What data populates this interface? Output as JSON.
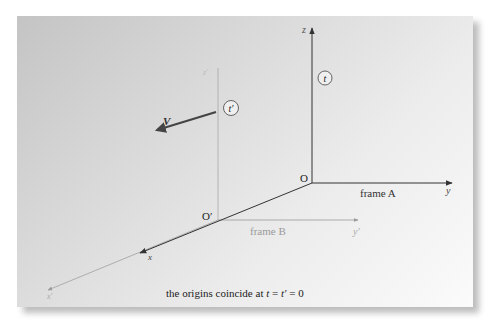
{
  "diagram": {
    "frame_a": {
      "name": "frame A",
      "origin_label": "O",
      "axes": {
        "x": "x",
        "y": "y",
        "z": "z"
      },
      "clock_label": "t",
      "color": "#333333"
    },
    "frame_b": {
      "name": "frame B",
      "origin_label": "O′",
      "axes": {
        "x": "x′",
        "y": "y′",
        "z": "z′"
      },
      "clock_label": "t′",
      "color": "#9a9a9a"
    },
    "velocity": {
      "label": "V",
      "color": "#555555"
    },
    "caption": {
      "text_prefix": "the origins coincide at ",
      "var1": "t",
      "eq1": " = ",
      "var2": "t′",
      "eq2": " = 0"
    }
  }
}
